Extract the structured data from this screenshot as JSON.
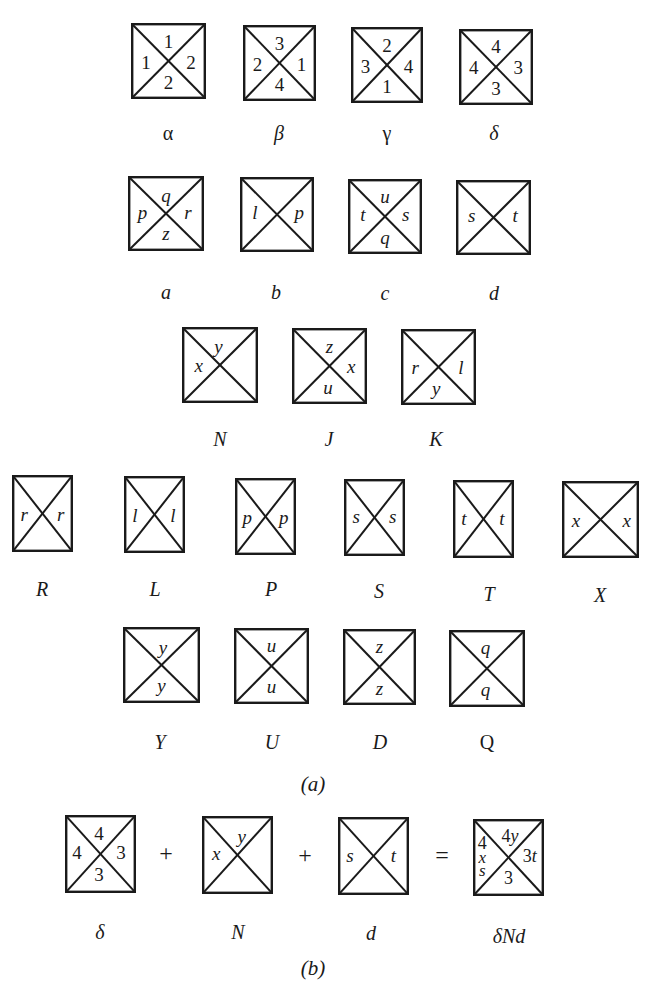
{
  "figure": {
    "part_a_caption": "(a)",
    "part_b_caption": "(b)",
    "tile_stroke_color": "#1a1a1a",
    "rows_a": [
      {
        "tiles": [
          {
            "label": "α",
            "top": "1",
            "right": "2",
            "bottom": "2",
            "left": "1"
          },
          {
            "label": "β",
            "top": "3",
            "right": "1",
            "bottom": "4",
            "left": "2"
          },
          {
            "label": "γ",
            "top": "2",
            "right": "4",
            "bottom": "1",
            "left": "3"
          },
          {
            "label": "δ",
            "top": "4",
            "right": "3",
            "bottom": "3",
            "left": "4"
          }
        ]
      },
      {
        "tiles": [
          {
            "label": "a",
            "top": "q",
            "right": "r",
            "bottom": "z",
            "left": "p"
          },
          {
            "label": "b",
            "top": "",
            "right": "p",
            "bottom": "",
            "left": "l"
          },
          {
            "label": "c",
            "top": "u",
            "right": "s",
            "bottom": "q",
            "left": "t"
          },
          {
            "label": "d",
            "top": "",
            "right": "t",
            "bottom": "",
            "left": "s"
          }
        ]
      },
      {
        "tiles": [
          {
            "label": "N",
            "top": "y",
            "right": "",
            "bottom": "",
            "left": "x"
          },
          {
            "label": "J",
            "top": "z",
            "right": "x",
            "bottom": "u",
            "left": ""
          },
          {
            "label": "K",
            "top": "",
            "right": "l",
            "bottom": "y",
            "left": "r"
          }
        ]
      },
      {
        "tiles": [
          {
            "label": "R",
            "top": "",
            "right": "r",
            "bottom": "",
            "left": "r"
          },
          {
            "label": "L",
            "top": "",
            "right": "l",
            "bottom": "",
            "left": "l"
          },
          {
            "label": "P",
            "top": "",
            "right": "p",
            "bottom": "",
            "left": "p"
          },
          {
            "label": "S",
            "top": "",
            "right": "s",
            "bottom": "",
            "left": "s"
          },
          {
            "label": "T",
            "top": "",
            "right": "t",
            "bottom": "",
            "left": "t"
          },
          {
            "label": "X",
            "top": "",
            "right": "x",
            "bottom": "",
            "left": "x"
          }
        ]
      },
      {
        "tiles": [
          {
            "label": "Y",
            "top": "y",
            "right": "",
            "bottom": "y",
            "left": ""
          },
          {
            "label": "U",
            "top": "u",
            "right": "",
            "bottom": "u",
            "left": ""
          },
          {
            "label": "D",
            "top": "z",
            "right": "",
            "bottom": "z",
            "left": ""
          },
          {
            "label": "Q",
            "top": "q",
            "right": "",
            "bottom": "q",
            "left": ""
          }
        ]
      }
    ],
    "equation_b": {
      "plus_1": "+",
      "plus_2": "+",
      "equals": "=",
      "tiles": [
        {
          "label": "δ",
          "top": "4",
          "right": "3",
          "bottom": "3",
          "left": "4"
        },
        {
          "label": "N",
          "top": "y",
          "right": "",
          "bottom": "",
          "left": "x"
        },
        {
          "label": "d",
          "top": "",
          "right": "t",
          "bottom": "",
          "left": "s"
        },
        {
          "label": "δNd",
          "top": "4y",
          "right": "3t",
          "bottom": "3",
          "left_lines": [
            "4",
            "x",
            "s"
          ]
        }
      ]
    }
  }
}
